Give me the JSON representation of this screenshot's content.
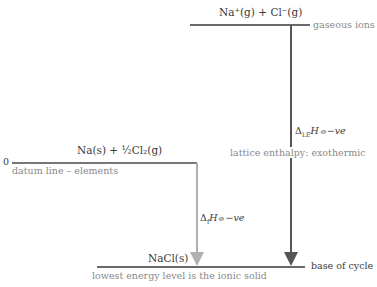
{
  "levels": {
    "top": {
      "species": "Na⁺(g) + Cl⁻(g)",
      "label": "gaseous ions"
    },
    "middle": {
      "zero": "0",
      "species_main": "Na(s) + ",
      "species_frac": "½",
      "species_tail": "Cl₂(g)",
      "label": "datum line – elements"
    },
    "bottom": {
      "species": "NaCl(s)",
      "label": "lowest energy level is the ionic solid",
      "right_label": "base of cycle"
    }
  },
  "arrows": {
    "lattice": {
      "delta": "Δ",
      "sub": "LE",
      "rest": "H⦵−ve",
      "label": "lattice enthalpy: exothermic",
      "color": "#555555"
    },
    "formation": {
      "delta": "Δ",
      "sub": "f",
      "rest": "H⦵−ve",
      "color": "#b0b0b0"
    }
  }
}
